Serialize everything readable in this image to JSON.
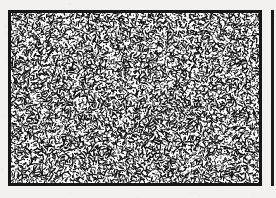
{
  "figure": {
    "kind": "random-dot-texture-plate",
    "caption": "",
    "has_text": false,
    "has_axes": false,
    "has_legend": false,
    "page_background": "#f2f1ef",
    "canvas_width": 276,
    "canvas_height": 198
  },
  "panels": [
    {
      "id": "main-texture-panel",
      "label": "",
      "x": 8,
      "y": 10,
      "width": 254,
      "height": 176,
      "border_width": 3,
      "border_color": "#161616",
      "fill_color": "#ffffff",
      "texture": {
        "type": "random-oriented-strokes",
        "seed": 20240517,
        "element_count": 7400,
        "stroke_color": "#121212",
        "stroke_min_length": 1.6,
        "stroke_max_length": 4.4,
        "stroke_min_width": 0.75,
        "stroke_max_width": 1.5,
        "orientation": "uniform-random-0-360",
        "distribution": "uniform-jittered-grid",
        "coverage_fraction": 0.38,
        "dot_fraction": 0.3
      }
    },
    {
      "id": "right-partial-panel",
      "label": "",
      "x": 271,
      "y": 10,
      "width": 14,
      "height": 176,
      "border_width": 3,
      "border_color": "#1b1b1b",
      "fill_color": "#ffffff",
      "cropped": true,
      "texture": {
        "type": "none",
        "seed": 0,
        "element_count": 0,
        "stroke_color": "#121212",
        "stroke_min_length": 0,
        "stroke_max_length": 0,
        "stroke_min_width": 0,
        "stroke_max_width": 0,
        "orientation": "none",
        "distribution": "none",
        "coverage_fraction": 0,
        "dot_fraction": 0
      }
    }
  ],
  "grain": {
    "seed": 8812,
    "speck_count": 430,
    "color": "#b9b7b3"
  }
}
